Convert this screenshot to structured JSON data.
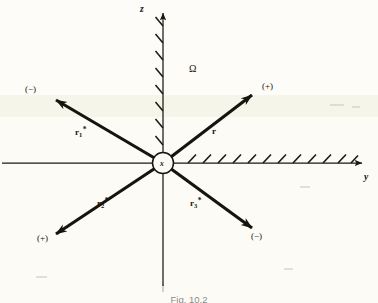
{
  "figure": {
    "caption": "Fig. 10.2",
    "origin_label": "x",
    "region_label": "Ω",
    "axes": [
      {
        "name": "z-axis",
        "label": "z",
        "direction": "up",
        "hatched": true
      },
      {
        "name": "y-axis",
        "label": "y",
        "direction": "right",
        "hatched": true
      }
    ],
    "vectors": [
      {
        "id": "r1star",
        "label_r": "r",
        "label_sub": "1",
        "label_sup": "*",
        "sign": "(−)",
        "quadrant": "upper-left"
      },
      {
        "id": "r",
        "label_r": "r",
        "label_sub": "",
        "label_sup": "",
        "sign": "(+)",
        "quadrant": "upper-right"
      },
      {
        "id": "r2star",
        "label_r": "r",
        "label_sub": "2",
        "label_sup": "*",
        "sign": "(+)",
        "quadrant": "lower-left"
      },
      {
        "id": "r3star",
        "label_r": "r",
        "label_sub": "3",
        "label_sup": "*",
        "sign": "(−)",
        "quadrant": "lower-right"
      }
    ],
    "colors": {
      "ink": "#16140f",
      "axis": "#1a1813",
      "paper": "#fbfaf5",
      "paper_band": "#f5f3e6"
    }
  }
}
